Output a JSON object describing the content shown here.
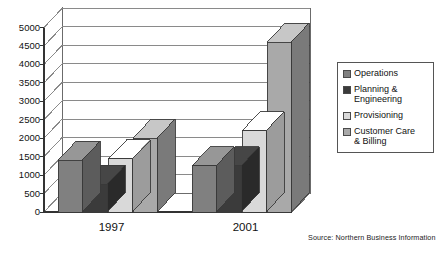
{
  "chart_data": {
    "type": "bar",
    "title": "",
    "subtitle": "",
    "xlabel": "",
    "ylabel": "",
    "categories": [
      "1997",
      "2001"
    ],
    "ylim": [
      0,
      5000
    ],
    "ytick_labels": [
      "0",
      "500",
      "1000",
      "1500",
      "2000",
      "2500",
      "3000",
      "3500",
      "4000",
      "4500",
      "5000"
    ],
    "ytick_values": [
      0,
      500,
      1000,
      1500,
      2000,
      2500,
      3000,
      3500,
      4000,
      4500,
      5000
    ],
    "grid": true,
    "grid_axis": "y",
    "three_d": true,
    "legend_position": "right",
    "series": [
      {
        "name": "Operations",
        "color": "#808080",
        "values": [
          1400,
          1250
        ]
      },
      {
        "name": "Planning &\nEngineering",
        "color": "#3b3b3b",
        "values": [
          750,
          1250
        ]
      },
      {
        "name": "Provisioning",
        "color": "#d9d9d9",
        "values": [
          1450,
          2200
        ]
      },
      {
        "name": "Customer Care\n& Billing",
        "color": "#a9a9a9",
        "values": [
          2000,
          4600
        ]
      }
    ],
    "annotations": [
      "Source: Northern Business Information"
    ]
  },
  "legend": {
    "items": [
      {
        "label": "Operations",
        "color": "#808080"
      },
      {
        "label": "Planning &\nEngineering",
        "color": "#3b3b3b"
      },
      {
        "label": "Provisioning",
        "color": "#d9d9d9"
      },
      {
        "label": "Customer Care\n& Billing",
        "color": "#a9a9a9"
      }
    ]
  },
  "source_note": "Source: Northern Business Information"
}
